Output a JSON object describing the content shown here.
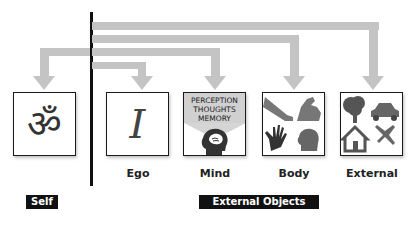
{
  "diagram": {
    "nodes": [
      {
        "id": "self",
        "label": "",
        "icon": "om-symbol",
        "glyph": "ॐ"
      },
      {
        "id": "ego",
        "label": "Ego",
        "icon": "letter-i",
        "glyph": "I"
      },
      {
        "id": "mind",
        "label": "Mind",
        "icon": "head-with-brain",
        "text_lines": [
          "PERCEPTION",
          "THOUGHTS",
          "MEMORY"
        ]
      },
      {
        "id": "body",
        "label": "Body",
        "icon": "body-parts",
        "parts": [
          "leg",
          "arm",
          "hand",
          "head"
        ]
      },
      {
        "id": "external",
        "label": "External",
        "icon": "external-objects",
        "parts": [
          "tree",
          "car",
          "house",
          "airplane"
        ]
      }
    ],
    "groups": [
      {
        "id": "self-group",
        "label": "Self"
      },
      {
        "id": "external-group",
        "label": "External Objects"
      }
    ],
    "arrows": [
      {
        "from": "divider",
        "to": "self"
      },
      {
        "from": "divider",
        "to": "ego"
      },
      {
        "from": "divider",
        "to": "mind"
      },
      {
        "from": "divider",
        "to": "body"
      },
      {
        "from": "divider",
        "to": "external"
      }
    ],
    "colors": {
      "arrow": "#c4c4c4",
      "border": "#1a1a1a",
      "tag_bg": "#111111",
      "tag_fg": "#ffffff"
    }
  }
}
